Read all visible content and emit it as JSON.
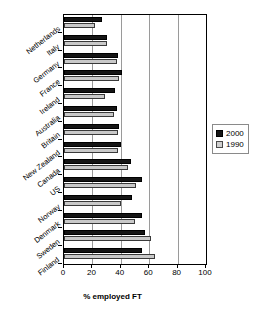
{
  "chart_data": {
    "type": "bar",
    "orientation": "horizontal",
    "title": "",
    "xlabel": "% employed FT",
    "ylabel": "",
    "xlim": [
      0,
      100
    ],
    "xticks": [
      0,
      20,
      40,
      60,
      80,
      100
    ],
    "grid": "vertical gridlines at 20, 40, 60, 80",
    "legend_position": "right",
    "categories": [
      "Netherlands",
      "Italy",
      "Germany",
      "France",
      "Ireland",
      "Australia",
      "Britain",
      "New Zealand",
      "Canada",
      "US",
      "Norway",
      "Denmark",
      "Sweden",
      "Finland"
    ],
    "series": [
      {
        "name": "2000",
        "color": "#151515",
        "values": [
          27,
          30,
          38,
          41,
          36,
          37,
          39,
          40,
          47,
          55,
          48,
          55,
          57,
          55
        ]
      },
      {
        "name": "1990",
        "color": "#c9c9c9",
        "values": [
          22,
          30,
          37,
          39,
          29,
          35,
          38,
          38,
          45,
          51,
          40,
          50,
          61,
          64
        ]
      }
    ]
  },
  "legend": {
    "entries": [
      {
        "label": "2000"
      },
      {
        "label": "1990"
      }
    ]
  },
  "axis": {
    "x_title": "% employed FT"
  }
}
